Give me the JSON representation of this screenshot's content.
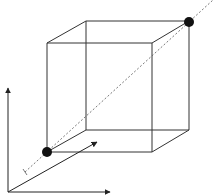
{
  "diagram": {
    "type": "cube-with-diagonal",
    "colors": {
      "background": "#ffffff",
      "stroke": "#333333",
      "dot": "#111111",
      "dashed": "#555555"
    },
    "cube": {
      "front_face": [
        [
          47,
          43
        ],
        [
          152,
          43
        ],
        [
          152,
          152
        ],
        [
          47,
          152
        ]
      ],
      "back_face": [
        [
          86,
          21
        ],
        [
          189,
          21
        ],
        [
          189,
          130
        ],
        [
          86,
          130
        ]
      ]
    },
    "points": [
      {
        "name": "origin-corner",
        "x": 47,
        "y": 152
      },
      {
        "name": "opposite-corner",
        "x": 189,
        "y": 22
      }
    ],
    "diagonal": {
      "x1": 25,
      "y1": 172,
      "x2": 213,
      "y2": 0,
      "style": "dashed"
    },
    "axes": {
      "origin": [
        8,
        192
      ],
      "vertical_end": [
        8,
        87
      ],
      "horizontal_end": [
        110,
        192
      ],
      "depth_end": [
        97,
        142
      ]
    }
  }
}
